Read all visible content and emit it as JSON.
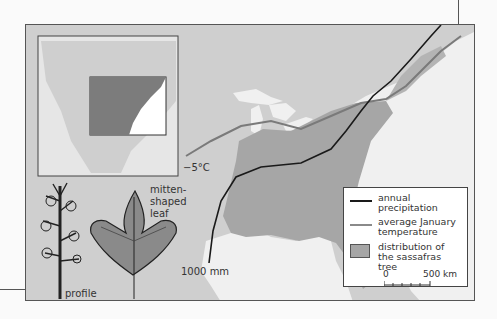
{
  "map": {
    "labels": {
      "temperature_line": "−5°C",
      "precipitation_line": "1000 mm",
      "leaf_label_1": "mitten-",
      "leaf_label_2": "shaped",
      "leaf_label_3": "leaf",
      "profile_label": "profile"
    },
    "legend": {
      "items": [
        {
          "symbol": "black-line",
          "label_1": "annual",
          "label_2": "precipitation"
        },
        {
          "symbol": "gray-line",
          "label_1": "average January",
          "label_2": "temperature"
        },
        {
          "symbol": "gray-box",
          "label_1": "distribution of",
          "label_2": "the sassafras tree"
        }
      ],
      "scale": {
        "start": "0",
        "end": "500 km"
      }
    },
    "colors": {
      "land": "#cfcfcf",
      "water": "#f2f2f2",
      "distribution": "#a6a6a6",
      "precip_line": "#1a1a1a",
      "temp_line": "#7a7a7a"
    }
  }
}
